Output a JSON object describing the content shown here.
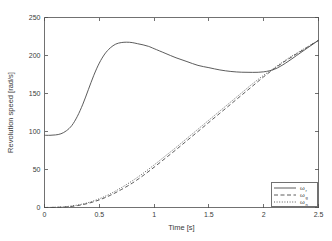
{
  "chart_data": {
    "type": "line",
    "title": "",
    "xlabel": "Time [s]",
    "ylabel": "Revolution speed [rad/s]",
    "xlim": [
      0,
      2.5
    ],
    "ylim": [
      0,
      250
    ],
    "xticks": [
      "0",
      "0.5",
      "1",
      "1.5",
      "2",
      "2.5"
    ],
    "xtick_values": [
      0,
      0.5,
      1,
      1.5,
      2,
      2.5
    ],
    "yticks": [
      "0",
      "50",
      "100",
      "150",
      "200",
      "250"
    ],
    "ytick_values": [
      0,
      50,
      100,
      150,
      200,
      250
    ],
    "grid": false,
    "legend_position": "lower right",
    "series": [
      {
        "name": "omega_r",
        "label": "ω",
        "subscript": "r",
        "style": "solid",
        "x": [
          0,
          0.05,
          0.1,
          0.15,
          0.2,
          0.25,
          0.3,
          0.35,
          0.4,
          0.45,
          0.5,
          0.55,
          0.6,
          0.65,
          0.7,
          0.75,
          0.8,
          0.85,
          0.9,
          0.95,
          1.0,
          1.1,
          1.2,
          1.3,
          1.4,
          1.5,
          1.6,
          1.7,
          1.8,
          1.9,
          2.0,
          2.1,
          2.2,
          2.3,
          2.4,
          2.5
        ],
        "values": [
          95,
          95,
          95.5,
          97,
          101,
          108,
          120,
          136,
          155,
          174,
          190,
          202,
          210,
          215,
          217,
          217.5,
          217,
          215.5,
          214,
          212,
          209,
          203,
          197,
          192,
          187,
          184,
          181,
          179,
          178,
          177.8,
          178.5,
          182,
          190,
          200,
          210,
          220
        ]
      },
      {
        "name": "omega_s",
        "label": "ω",
        "subscript": "g",
        "style": "dashed",
        "x": [
          0,
          0.1,
          0.2,
          0.3,
          0.4,
          0.5,
          0.6,
          0.7,
          0.8,
          0.9,
          1.0,
          1.1,
          1.2,
          1.3,
          1.4,
          1.5,
          1.6,
          1.7,
          1.8,
          1.9,
          2.0,
          2.1,
          2.2,
          2.3,
          2.4,
          2.5
        ],
        "values": [
          0,
          0.2,
          0.8,
          2.5,
          5.5,
          10,
          16,
          23.5,
          32,
          42,
          53,
          64.5,
          76,
          88,
          100,
          112,
          124,
          136,
          148,
          160,
          172,
          183,
          193,
          202,
          211,
          220
        ]
      },
      {
        "name": "omega_m",
        "label": "ω",
        "subscript": "n",
        "style": "dotted",
        "x": [
          0,
          0.1,
          0.2,
          0.3,
          0.4,
          0.5,
          0.6,
          0.7,
          0.8,
          0.9,
          1.0,
          1.1,
          1.2,
          1.3,
          1.4,
          1.5,
          1.6,
          1.7,
          1.8,
          1.9,
          2.0,
          2.1,
          2.2,
          2.3,
          2.4,
          2.5
        ],
        "values": [
          0,
          0.3,
          1.2,
          3.2,
          6.5,
          11.5,
          18,
          26,
          35,
          45,
          56,
          67.5,
          79,
          91,
          103,
          115,
          127,
          139,
          151,
          163,
          174,
          184,
          194,
          203,
          211.5,
          220
        ]
      }
    ]
  }
}
